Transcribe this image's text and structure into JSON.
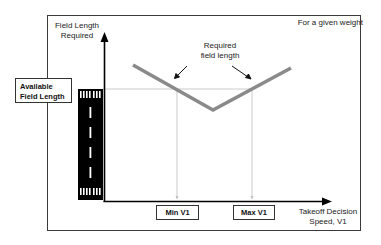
{
  "diagram": {
    "corner_note": "For a given weight",
    "y_axis_label": [
      "Field Length",
      "Required"
    ],
    "x_axis_label": [
      "Takeoff Decision",
      "Speed, V1"
    ],
    "curve_label": [
      "Required",
      "field length"
    ],
    "available_field_length_label": [
      "Available",
      "Field Length"
    ],
    "min_v1_label": "Min V1",
    "max_v1_label": "Max V1",
    "colors": {
      "curve": "#8a8a8a",
      "axis": "#000000",
      "guide_lines": "#bdbdbd",
      "runway": "#000000",
      "runway_markings": "#ffffff",
      "frame": "#3a3a3a"
    }
  }
}
